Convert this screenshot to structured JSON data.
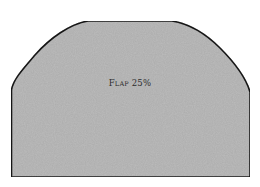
{
  "diagram": {
    "shape": {
      "name": "flap-pattern",
      "fill": "#bdbdbd",
      "stroke": "#1a1a1a"
    },
    "label": {
      "first_letter": "F",
      "rest": "LAP",
      "value": "25%"
    }
  }
}
